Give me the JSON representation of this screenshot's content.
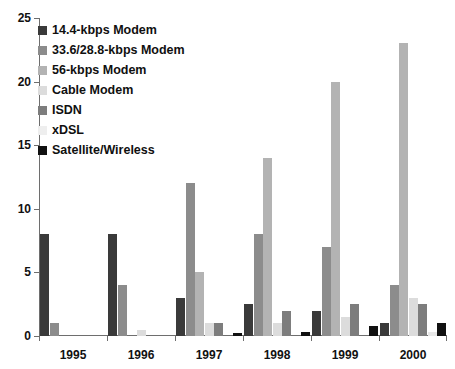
{
  "chart_data": {
    "type": "bar",
    "title": "",
    "xlabel": "",
    "ylabel": "",
    "ylim": [
      0,
      25
    ],
    "yticks": [
      0,
      5,
      10,
      15,
      20,
      25
    ],
    "grid": false,
    "legend_position": "top-left",
    "categories": [
      "1995",
      "1996",
      "1997",
      "1998",
      "1999",
      "2000"
    ],
    "series": [
      {
        "name": "14.4-kbps Modem",
        "color": "#3a3a3a",
        "values": [
          8,
          8,
          3,
          2.5,
          2,
          1
        ]
      },
      {
        "name": "33.6/28.8-kbps Modem",
        "color": "#8c8c8c",
        "values": [
          1,
          4,
          12,
          8,
          7,
          4
        ]
      },
      {
        "name": "56-kbps Modem",
        "color": "#b3b3b3",
        "values": [
          0,
          0,
          5,
          14,
          20,
          23
        ]
      },
      {
        "name": "Cable Modem",
        "color": "#dcdcdc",
        "values": [
          0,
          0.5,
          1,
          1,
          1.5,
          3
        ]
      },
      {
        "name": "ISDN",
        "color": "#7d7d7d",
        "values": [
          0,
          0,
          1,
          2,
          2.5,
          2.5
        ]
      },
      {
        "name": "xDSL",
        "color": "#e8e8e8",
        "values": [
          0,
          0,
          0,
          0,
          0,
          0.3
        ]
      },
      {
        "name": "Satellite/Wireless",
        "color": "#111111",
        "values": [
          0,
          0,
          0.2,
          0.3,
          0.8,
          1
        ]
      }
    ]
  },
  "axis": {
    "y_tick_labels": [
      "0",
      "5",
      "10",
      "15",
      "20",
      "25"
    ],
    "x_tick_labels": [
      "1995",
      "1996",
      "1997",
      "1998",
      "1999",
      "2000"
    ]
  },
  "legend": {
    "items": [
      {
        "label": "14.4-kbps Modem",
        "color": "#3a3a3a"
      },
      {
        "label": "33.6/28.8-kbps Modem",
        "color": "#8c8c8c"
      },
      {
        "label": "56-kbps Modem",
        "color": "#b3b3b3"
      },
      {
        "label": "Cable Modem",
        "color": "#dcdcdc"
      },
      {
        "label": "ISDN",
        "color": "#7d7d7d"
      },
      {
        "label": "xDSL",
        "color": "#eeeeee"
      },
      {
        "label": "Satellite/Wireless",
        "color": "#111111"
      }
    ]
  }
}
